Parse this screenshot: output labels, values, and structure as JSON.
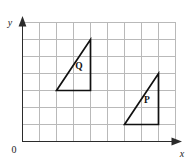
{
  "chart_data": {
    "type": "scatter",
    "title": "",
    "xlabel": "x",
    "ylabel": "y",
    "origin_label": "0",
    "grid": true,
    "grid_cell_px": 17,
    "xlim": [
      0,
      9
    ],
    "ylim": [
      0,
      7
    ],
    "xticklabels": [],
    "yticklabels": [],
    "legend": "none",
    "annotations": [
      {
        "text": "Q",
        "x": 3.35,
        "y": 4.05
      },
      {
        "text": "P",
        "x": 7.35,
        "y": 2.05
      }
    ],
    "series": [
      {
        "name": "Q",
        "label": "Q",
        "kind": "triangle",
        "closed": true,
        "vertices": [
          {
            "x": 2,
            "y": 3
          },
          {
            "x": 4,
            "y": 3
          },
          {
            "x": 4,
            "y": 6
          }
        ],
        "stroke": "#111111",
        "fill": "none"
      },
      {
        "name": "P",
        "label": "P",
        "kind": "triangle",
        "closed": true,
        "vertices": [
          {
            "x": 6,
            "y": 1
          },
          {
            "x": 8,
            "y": 1
          },
          {
            "x": 8,
            "y": 4
          }
        ],
        "stroke": "#111111",
        "fill": "none"
      }
    ]
  },
  "figure": {
    "axis": {
      "x_label": "x",
      "y_label": "y",
      "origin_label": "0"
    },
    "shapes": {
      "q_label": "Q",
      "p_label": "P"
    },
    "colors": {
      "background": "#ffffff",
      "grid": "#b9b9b9",
      "axis": "#2b2b2b",
      "shape_stroke": "#111111"
    }
  }
}
